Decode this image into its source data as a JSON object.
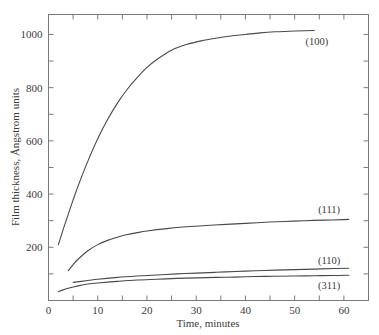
{
  "chart_data": {
    "type": "line",
    "title": "",
    "subtitle": "",
    "xlabel": "Time, minutes",
    "ylabel": "Film thickness, Ångstrom units",
    "xlim": [
      0,
      65
    ],
    "ylim": [
      0,
      1075
    ],
    "grid": false,
    "legend_position": "inline-end-of-curve",
    "x_major_ticks": [
      0,
      10,
      20,
      30,
      40,
      50,
      60
    ],
    "x_major_tick_labels": [
      "0",
      "10",
      "20",
      "30",
      "40",
      "50",
      "60"
    ],
    "x_minor_ticks": [
      5,
      15,
      25,
      35,
      45,
      55,
      65
    ],
    "y_major_ticks": [
      200,
      400,
      600,
      800,
      1000
    ],
    "y_major_tick_labels": [
      "200",
      "400",
      "600",
      "800",
      "1000"
    ],
    "y_minor_ticks": [
      100,
      300,
      500,
      700,
      900
    ],
    "series": [
      {
        "name": "(100)",
        "label": "(100)",
        "color": "#494949",
        "label_x": 54.5,
        "label_y": 975,
        "x": [
          2,
          3,
          4,
          5,
          6,
          8,
          10,
          12,
          14,
          16,
          18,
          20,
          22,
          25,
          28,
          31,
          34,
          37,
          40,
          43,
          46,
          49,
          52,
          54
        ],
        "y": [
          210,
          268,
          324,
          378,
          430,
          524,
          608,
          680,
          742,
          794,
          838,
          876,
          906,
          941,
          962,
          976,
          986,
          994,
          1000,
          1006,
          1010,
          1012,
          1014,
          1015
        ]
      },
      {
        "name": "(111)",
        "label": "(111)",
        "color": "#494949",
        "label_x": 57,
        "label_y": 345,
        "x": [
          4,
          5,
          6,
          8,
          10,
          12,
          14,
          16,
          18,
          20,
          24,
          28,
          32,
          36,
          40,
          44,
          48,
          52,
          56,
          60,
          61
        ],
        "y": [
          112,
          135,
          155,
          187,
          210,
          226,
          238,
          248,
          255,
          261,
          270,
          277,
          282,
          286,
          290,
          294,
          297,
          300,
          302,
          304,
          305
        ]
      },
      {
        "name": "(110)",
        "label": "(110)",
        "color": "#494949",
        "label_x": 57,
        "label_y": 152,
        "x": [
          5,
          8,
          10,
          14,
          18,
          22,
          26,
          30,
          34,
          38,
          42,
          46,
          50,
          54,
          58,
          61
        ],
        "y": [
          68,
          75,
          80,
          87,
          92,
          96,
          100,
          103,
          106,
          109,
          112,
          114,
          116,
          118,
          120,
          121
        ]
      },
      {
        "name": "(311)",
        "label": "(311)",
        "color": "#494949",
        "label_x": 57,
        "label_y": 60,
        "x": [
          2,
          3,
          4,
          6,
          8,
          10,
          14,
          18,
          22,
          26,
          30,
          34,
          38,
          42,
          46,
          50,
          54,
          58,
          61
        ],
        "y": [
          33,
          40,
          46,
          55,
          62,
          66,
          72,
          77,
          80,
          83,
          85,
          87,
          88,
          90,
          91,
          92,
          93,
          94,
          95
        ]
      }
    ]
  }
}
